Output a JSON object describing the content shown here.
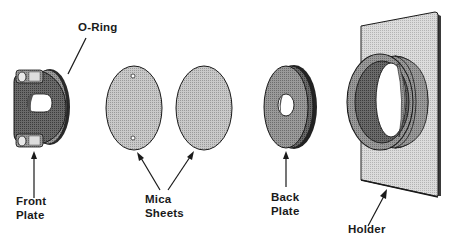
{
  "diagram": {
    "type": "exploded-assembly",
    "components": [
      {
        "id": "front-plate",
        "label_lines": [
          "Front",
          "Plate"
        ]
      },
      {
        "id": "o-ring",
        "label_lines": [
          "O-Ring"
        ]
      },
      {
        "id": "mica-sheets",
        "label_lines": [
          "Mica",
          "Sheets"
        ],
        "count": 2
      },
      {
        "id": "back-plate",
        "label_lines": [
          "Back",
          "Plate"
        ]
      },
      {
        "id": "holder",
        "label_lines": [
          "Holder"
        ]
      }
    ]
  },
  "labels": {
    "o_ring": "O-Ring",
    "front_plate_1": "Front",
    "front_plate_2": "Plate",
    "mica_1": "Mica",
    "mica_2": "Sheets",
    "back_plate_1": "Back",
    "back_plate_2": "Plate",
    "holder": "Holder"
  },
  "colors": {
    "ink": "#1a1a1a",
    "dark_fill": "#5a5a5a",
    "mid_fill": "#8c8c8c",
    "light_fill": "#bdbdbd",
    "pale_fill": "#d4d4d4",
    "background": "#ffffff"
  }
}
